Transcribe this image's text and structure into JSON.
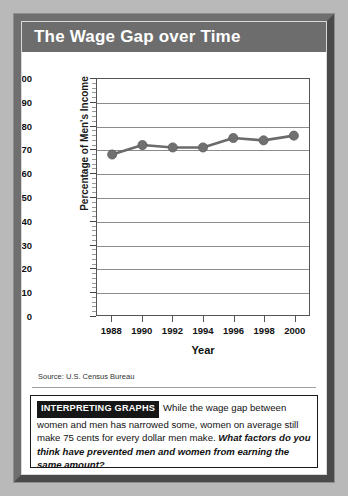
{
  "figure": {
    "title": "The Wage Gap over Time",
    "source_note": "Source: U.S. Census Bureau"
  },
  "caption": {
    "badge": "INTERPRETING GRAPHS",
    "body": "While the wage gap between women and men has narrowed some, women on average still make 75 cents for every dollar men make. ",
    "question": "What factors do you think have prevented men and women from earning the same amount?"
  },
  "colors": {
    "title_bar": "#6d6d6d",
    "frame_light": "#6f6f6f",
    "frame_dark": "#4a4a4a",
    "series_line": "#6b6b6b",
    "marker": "#707070",
    "gridline": "#8c8c8c",
    "badge_background": "#161616"
  },
  "chart_data": {
    "type": "line",
    "title": "The Wage Gap over Time",
    "xlabel": "Year",
    "ylabel": "Percentage of Men's Income",
    "x": [
      1988,
      1990,
      1992,
      1994,
      1996,
      1998,
      2000
    ],
    "categories": [
      "1988",
      "1990",
      "1992",
      "1994",
      "1996",
      "1998",
      "2000"
    ],
    "values": [
      68,
      72,
      71,
      71,
      75,
      74,
      76
    ],
    "series": [
      {
        "name": "Percentage of Men's Income",
        "values": [
          68,
          72,
          71,
          71,
          75,
          74,
          76
        ]
      }
    ],
    "ylim": [
      0,
      100
    ],
    "ytick_labels": [
      "100",
      "90",
      "80",
      "70",
      "60",
      "50",
      "40",
      "30",
      "20",
      "10",
      "0"
    ],
    "ytick_values": [
      100,
      90,
      80,
      70,
      60,
      50,
      40,
      30,
      20,
      10,
      0
    ],
    "ytick_step": 10,
    "yminor_step": 2,
    "xlim": [
      1987,
      2001
    ],
    "grid": "horizontal",
    "legend": "none",
    "marker": "circle",
    "source": "U.S. Census Bureau"
  }
}
